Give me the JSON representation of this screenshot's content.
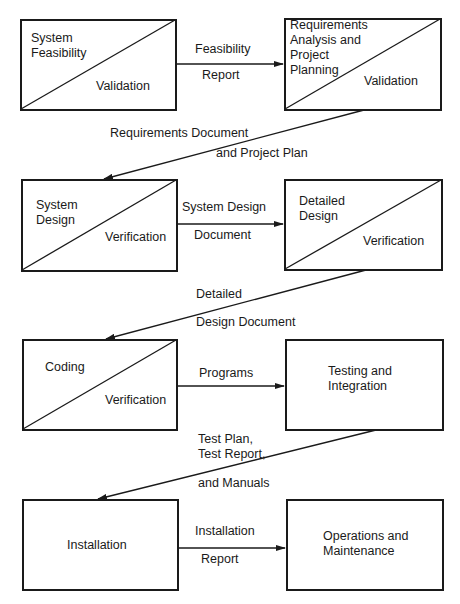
{
  "phases": [
    {
      "id": "feasibility",
      "lines": [
        "System",
        "Feasibility"
      ],
      "check": "Validation"
    },
    {
      "id": "requirements",
      "lines": [
        "Requirements",
        "Analysis and",
        "Project",
        "Planning"
      ],
      "check": "Validation"
    },
    {
      "id": "system-design",
      "lines": [
        "System",
        "Design"
      ],
      "check": "Verification"
    },
    {
      "id": "detailed-design",
      "lines": [
        "Detailed",
        "Design"
      ],
      "check": "Verification"
    },
    {
      "id": "coding",
      "lines": [
        "Coding"
      ],
      "check": "Verification"
    },
    {
      "id": "testing",
      "lines": [
        "Testing and",
        "Integration"
      ],
      "check": ""
    },
    {
      "id": "installation",
      "lines": [
        "Installation"
      ],
      "check": ""
    },
    {
      "id": "operations",
      "lines": [
        "Operations and",
        "Maintenance"
      ],
      "check": ""
    }
  ],
  "flows": [
    {
      "top": "Feasibility",
      "bottom": "Report"
    },
    {
      "top": "Requirements Document",
      "bottom": "and Project Plan"
    },
    {
      "top": "System Design",
      "bottom": "Document"
    },
    {
      "top": "Detailed",
      "bottom": "Design Document"
    },
    {
      "top": "Programs",
      "bottom": ""
    },
    {
      "top": "Test Plan,",
      "mid": "Test Report,",
      "bottom": "and Manuals"
    },
    {
      "top": "Installation",
      "bottom": "Report"
    }
  ]
}
